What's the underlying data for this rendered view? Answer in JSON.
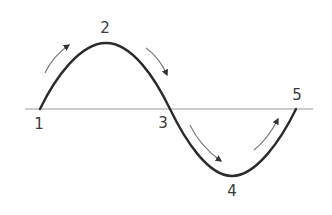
{
  "diagram": {
    "type": "sine-wave-cycle",
    "colors": {
      "wave": "#2b2b2b",
      "axis": "#9a9a9a",
      "arrows": "#555555",
      "labels": "#3a3a3a"
    },
    "axis": {
      "x1": 25,
      "x2": 313,
      "y": 109
    },
    "wave": {
      "start": [
        40,
        109
      ],
      "peak": [
        106,
        43
      ],
      "mid": [
        170,
        109
      ],
      "trough": [
        232,
        176
      ],
      "end": [
        296,
        109
      ]
    },
    "points": [
      {
        "id": "1",
        "label": "1",
        "x": 39,
        "y": 129
      },
      {
        "id": "2",
        "label": "2",
        "x": 105,
        "y": 33
      },
      {
        "id": "3",
        "label": "3",
        "x": 163,
        "y": 128
      },
      {
        "id": "4",
        "label": "4",
        "x": 232,
        "y": 196
      },
      {
        "id": "5",
        "label": "5",
        "x": 297,
        "y": 100
      }
    ],
    "arrows": [
      {
        "from": "1",
        "to": "2",
        "direction": "up-right"
      },
      {
        "from": "2",
        "to": "3",
        "direction": "down-right"
      },
      {
        "from": "3",
        "to": "4",
        "direction": "down-right"
      },
      {
        "from": "4",
        "to": "5",
        "direction": "up-right"
      }
    ]
  }
}
